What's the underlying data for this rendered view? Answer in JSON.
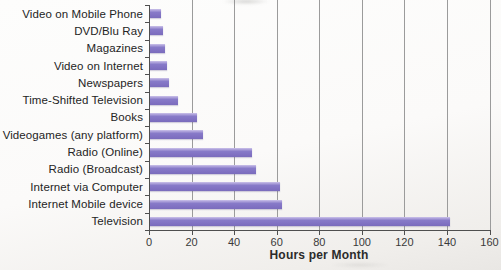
{
  "chart_data": {
    "type": "bar",
    "orientation": "horizontal",
    "title": "",
    "xlabel": "Hours per Month",
    "ylabel": "",
    "xlim": [
      0,
      160
    ],
    "xticks": [
      0,
      20,
      40,
      60,
      80,
      100,
      120,
      140,
      160
    ],
    "grid": true,
    "legend": "none",
    "categories": [
      "Video on Mobile Phone",
      "DVD/Blu Ray",
      "Magazines",
      "Video on Internet",
      "Newspapers",
      "Time-Shifted Television",
      "Books",
      "Videogames (any platform)",
      "Radio (Online)",
      "Radio (Broadcast)",
      "Internet via Computer",
      "Internet Mobile device",
      "Television"
    ],
    "values": [
      5,
      6,
      7,
      8,
      9,
      13,
      22,
      25,
      48,
      50,
      61,
      62,
      141
    ],
    "colors": {
      "bar": "#8172c3",
      "bar_highlight": "#cbc2e9",
      "gridline": "#9b9b9b",
      "axis": "#4f4f4f",
      "label_text": "#242424",
      "tick_text": "#3a3a3a",
      "background": "#fbfaf9"
    }
  }
}
